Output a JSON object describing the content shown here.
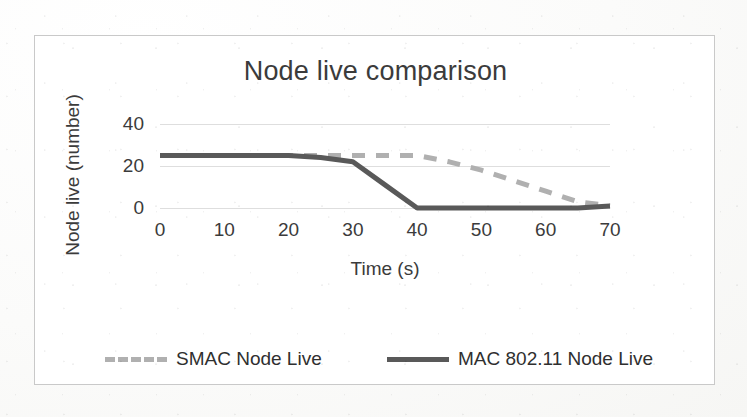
{
  "chart_data": {
    "type": "line",
    "title": "Node live comparison",
    "xlabel": "Time (s)",
    "ylabel": "Node live (number)",
    "xlim": [
      0,
      70
    ],
    "ylim": [
      0,
      40
    ],
    "xticks": [
      0,
      10,
      20,
      30,
      40,
      50,
      60,
      70
    ],
    "yticks": [
      0,
      20,
      40
    ],
    "grid": true,
    "legend_position": "bottom",
    "x": [
      0,
      10,
      20,
      25,
      30,
      35,
      40,
      45,
      50,
      55,
      60,
      65,
      70
    ],
    "series": [
      {
        "name": "SMAC Node Live",
        "style": "dashed",
        "color": "#b0b0b0",
        "values": [
          25,
          25,
          25,
          25,
          25,
          25,
          25,
          22,
          18,
          13,
          8,
          3,
          1
        ]
      },
      {
        "name": "MAC 802.11 Node Live",
        "style": "solid",
        "color": "#595959",
        "values": [
          25,
          25,
          25,
          24,
          22,
          11,
          0,
          0,
          0,
          0,
          0,
          0,
          1
        ]
      }
    ]
  },
  "legend": {
    "items": [
      {
        "label": "SMAC Node Live",
        "color": "#b0b0b0",
        "style": "dashed"
      },
      {
        "label": "MAC 802.11 Node Live",
        "color": "#595959",
        "style": "solid"
      }
    ]
  },
  "axis": {
    "x_tick_labels": [
      "0",
      "10",
      "20",
      "30",
      "40",
      "50",
      "60",
      "70"
    ],
    "y_tick_labels": [
      "40",
      "20",
      "0"
    ]
  },
  "colors": {
    "series_smac": "#b0b0b0",
    "series_mac": "#595959",
    "gridline": "#dedede",
    "frame": "#c9c9c9",
    "text": "#3b3b3b"
  }
}
